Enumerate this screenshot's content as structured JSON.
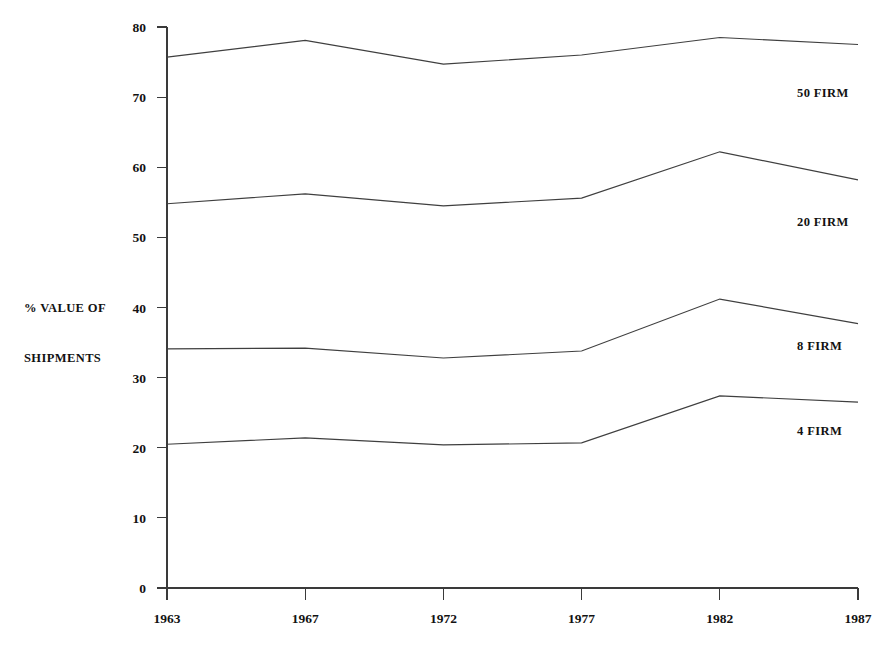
{
  "chart_data": {
    "type": "line",
    "title": "",
    "xlabel": "",
    "ylabel": "% VALUE OF SHIPMENTS",
    "ylabel_lines": [
      "% VALUE OF",
      "SHIPMENTS"
    ],
    "categories": [
      "1963",
      "1967",
      "1972",
      "1977",
      "1982",
      "1987"
    ],
    "x": [
      1963,
      1967,
      1972,
      1977,
      1982,
      1987
    ],
    "ylim": [
      0,
      80
    ],
    "ytick_labels": [
      "0",
      "10",
      "20",
      "30",
      "40",
      "50",
      "60",
      "70",
      "80"
    ],
    "yticks": [
      0,
      10,
      20,
      30,
      40,
      50,
      60,
      70,
      80
    ],
    "grid": false,
    "legend_position": "right-inline",
    "series": [
      {
        "name": "50 FIRM",
        "label": "50 FIRM",
        "values": [
          75.7,
          78.1,
          74.7,
          76.0,
          78.5,
          77.5
        ]
      },
      {
        "name": "20 FIRM",
        "label": "20 FIRM",
        "values": [
          54.8,
          56.2,
          54.5,
          55.6,
          62.2,
          58.2
        ]
      },
      {
        "name": "8 FIRM",
        "label": "8 FIRM",
        "values": [
          34.1,
          34.2,
          32.8,
          33.8,
          41.2,
          37.7
        ]
      },
      {
        "name": "4 FIRM",
        "label": "4 FIRM",
        "values": [
          20.5,
          21.4,
          20.4,
          20.7,
          27.4,
          26.5
        ]
      }
    ],
    "series_label_positions": [
      {
        "name": "50 FIRM",
        "x": 797,
        "y": 97
      },
      {
        "name": "20 FIRM",
        "x": 797,
        "y": 226
      },
      {
        "name": "8 FIRM",
        "x": 797,
        "y": 350
      },
      {
        "name": "4 FIRM",
        "x": 797,
        "y": 435
      }
    ],
    "colors": {
      "line": "#3f3f3f",
      "axis": "#3a3a3a",
      "text": "#121212",
      "background": "#ffffff"
    }
  },
  "geometry": {
    "plot_left": 167,
    "plot_right": 858,
    "plot_bottom": 588,
    "plot_top": 27,
    "px_per_unit": 7.0125
  }
}
